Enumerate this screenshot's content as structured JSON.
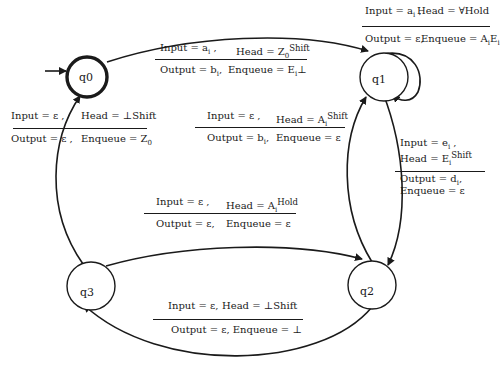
{
  "diagram": {
    "type": "state-machine",
    "states": [
      {
        "id": "q0",
        "label": "q0",
        "accepting": true,
        "initial": true
      },
      {
        "id": "q1",
        "label": "q1"
      },
      {
        "id": "q2",
        "label": "q2"
      },
      {
        "id": "q3",
        "label": "q3"
      }
    ],
    "transitions": [
      {
        "from": "q0",
        "to": "q1",
        "top": {
          "input": "Input = a",
          "input_sub": "i",
          "input_suffix": " ,",
          "head": "Head = Z",
          "head_sub": "0",
          "head_sup": "Shift"
        },
        "bottom": {
          "output": "Output = b",
          "output_sub": "i",
          "output_suffix": ",",
          "enqueue": "Enqueue = E",
          "enqueue_sub": "i",
          "enqueue_suffix": "⊥"
        }
      },
      {
        "from": "q1",
        "to": "q1",
        "top": {
          "input": "Input = a",
          "input_sub": "i",
          "input_suffix": " ,",
          "head": "Head = ∀Hold"
        },
        "bottom": {
          "output": "Output = ε,",
          "enqueue": "Enqueue = A",
          "enqueue_sub": "i",
          "enqueue_mid": "E",
          "enqueue_sub2": "i"
        }
      },
      {
        "from": "q2",
        "to": "q1",
        "top": {
          "input": "Input = ε ,",
          "head": "Head = A",
          "head_sub": "i",
          "head_sup": "Shift"
        },
        "bottom": {
          "output": "Output = b",
          "output_sub": "i",
          "output_suffix": ",",
          "enqueue": "Enqueue = ε"
        }
      },
      {
        "from": "q1",
        "to": "q2",
        "top": {
          "input": "Input = e",
          "input_sub": "i",
          "input_suffix": " ,",
          "head": "Head = E",
          "head_sub": "i",
          "head_sup": "Shift"
        },
        "bottom": {
          "output": "Output = d",
          "output_sub": "i",
          "output_suffix": ",",
          "enqueue": "Enqueue = ε"
        }
      },
      {
        "from": "q3",
        "to": "q2",
        "top": {
          "input": "Input = ε ,",
          "head": "Head = A",
          "head_sub": "i",
          "head_sup": "Hold"
        },
        "bottom": {
          "output": "Output = ε,",
          "enqueue": "Enqueue = ε"
        }
      },
      {
        "from": "q2",
        "to": "q3",
        "top": {
          "input": "Input = ε,",
          "head": "Head = ⊥Shift"
        },
        "bottom": {
          "output": "Output = ε, Enqueue = ⊥"
        }
      },
      {
        "from": "q3",
        "to": "q0",
        "top": {
          "input": "Input = ε ,",
          "head": "Head = ⊥Shift"
        },
        "bottom": {
          "output": "Output = ε ,",
          "enqueue": "Enqueue = Z",
          "enqueue_sub": "0"
        }
      }
    ]
  }
}
